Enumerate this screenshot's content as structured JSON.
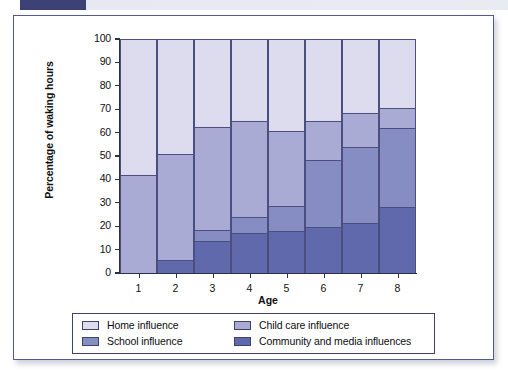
{
  "figure": {
    "top_strip_color": "#3c4176",
    "frame_color": "#535a8e"
  },
  "chart_data": {
    "type": "bar",
    "subtype": "stacked-100-percent",
    "title": "",
    "xlabel": "Age",
    "ylabel": "Percentage of waking hours",
    "categories": [
      "1",
      "2",
      "3",
      "4",
      "5",
      "6",
      "7",
      "8"
    ],
    "ylim": [
      0,
      100
    ],
    "yticks": [
      0,
      10,
      20,
      30,
      40,
      50,
      60,
      70,
      80,
      90,
      100
    ],
    "grid": false,
    "legend_position": "bottom",
    "stack_order_bottom_to_top": [
      "Community and media influences",
      "School influence",
      "Child care influence",
      "Home influence"
    ],
    "series": [
      {
        "name": "Community and media influences",
        "color": "#5f69ab",
        "values": [
          0,
          5.5,
          13.5,
          17,
          18,
          19.5,
          21.5,
          28
        ]
      },
      {
        "name": "School influence",
        "color": "#868dc2",
        "values": [
          0,
          0,
          5,
          7,
          10.5,
          29,
          32.5,
          34
        ]
      },
      {
        "name": "Child care influence",
        "color": "#a9abd4",
        "values": [
          42,
          45.5,
          44,
          41,
          32,
          16.5,
          14.5,
          8.5
        ]
      },
      {
        "name": "Home influence",
        "color": "#dcdcee",
        "values": [
          58,
          49,
          37.5,
          35,
          39.5,
          35,
          31.5,
          29.5
        ]
      }
    ],
    "cumulative_boundaries": {
      "community_top": [
        0,
        5.5,
        13.5,
        17,
        18,
        19.5,
        21.5,
        28
      ],
      "school_top": [
        0,
        5.5,
        18.5,
        24,
        28.5,
        48.5,
        54,
        62
      ],
      "child_care_top": [
        42,
        51,
        62.5,
        65,
        60.5,
        65,
        68.5,
        70.5
      ],
      "home_top": [
        100,
        100,
        100,
        100,
        100,
        100,
        100,
        100
      ]
    }
  },
  "legend": {
    "rows": [
      [
        {
          "label": "Home influence",
          "color": "#dcdcee"
        },
        {
          "label": "Child care influence",
          "color": "#a9abd4"
        }
      ],
      [
        {
          "label": "School influence",
          "color": "#868dc2"
        },
        {
          "label": "Community and media influences",
          "color": "#5f69ab"
        }
      ]
    ]
  }
}
